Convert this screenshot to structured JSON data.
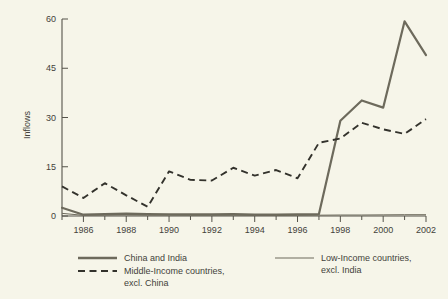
{
  "chart_data": {
    "type": "line",
    "title": "",
    "xlabel": "",
    "ylabel": "Inflows",
    "xlim": [
      1985,
      2002
    ],
    "ylim": [
      0,
      60
    ],
    "yticks": [
      0,
      15,
      30,
      45,
      60
    ],
    "ytick_labels": [
      "0",
      "15",
      "30",
      "45",
      "60"
    ],
    "xticks": [
      1986,
      1988,
      1990,
      1992,
      1994,
      1996,
      1998,
      2000,
      2002
    ],
    "xtick_labels": [
      "1986",
      "1988",
      "1990",
      "1992",
      "1994",
      "1996",
      "1998",
      "2000",
      "2002"
    ],
    "x": [
      1985,
      1986,
      1987,
      1988,
      1989,
      1990,
      1991,
      1992,
      1993,
      1994,
      1995,
      1996,
      1997,
      1998,
      1999,
      2000,
      2001,
      2002
    ],
    "grid": false,
    "legend_position": "below-axes",
    "series": [
      {
        "name": "China and India",
        "style": "solid-thick",
        "color": "#6d6a5c",
        "values": [
          2.5,
          0.4,
          0.6,
          0.7,
          0.6,
          0.5,
          0.5,
          0.5,
          0.6,
          0.4,
          0.4,
          0.5,
          0.6,
          29.0,
          35.2,
          33.0,
          59.3,
          49.0
        ]
      },
      {
        "name": "Middle-Income countries, excl. China",
        "style": "dashed",
        "color": "#33322c",
        "values": [
          9.0,
          5.5,
          10.0,
          6.3,
          2.8,
          13.6,
          11.0,
          10.8,
          14.7,
          12.3,
          14.0,
          11.5,
          22.3,
          23.6,
          28.4,
          26.4,
          25.0,
          29.5
        ]
      },
      {
        "name": "Low-Income countries, excl. India",
        "style": "solid-thin",
        "color": "#6d6a5c",
        "values": [
          0.8,
          0.2,
          0.25,
          0.3,
          0.25,
          0.25,
          0.2,
          0.2,
          0.25,
          0.15,
          0.15,
          0.2,
          0.25,
          0.3,
          0.3,
          0.35,
          0.4,
          0.4
        ]
      }
    ]
  },
  "axes": {
    "y_title": "Inflows"
  },
  "legend": {
    "entries": [
      {
        "line1": "China and India",
        "line2": ""
      },
      {
        "line1": "Middle-Income countries,",
        "line2": "excl. China"
      },
      {
        "line1": "Low-Income countries,",
        "line2": "excl. India"
      }
    ]
  }
}
